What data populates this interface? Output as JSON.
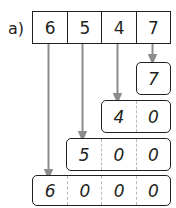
{
  "figure": {
    "part_label": "a)",
    "type": "place-value-decomposition",
    "number": "6547"
  },
  "top_row": {
    "name": "original-number-row",
    "cells": [
      "6",
      "5",
      "4",
      "7"
    ]
  },
  "result_rows": [
    {
      "name": "ones-row",
      "value": "7",
      "cells": [
        "7"
      ],
      "place": "ones"
    },
    {
      "name": "tens-row",
      "value": "40",
      "cells": [
        "4",
        "0"
      ],
      "place": "tens"
    },
    {
      "name": "hundreds-row",
      "value": "500",
      "cells": [
        "5",
        "0",
        "0"
      ],
      "place": "hundreds"
    },
    {
      "name": "thousands-row",
      "value": "6000",
      "cells": [
        "6",
        "0",
        "0",
        "0"
      ],
      "place": "thousands"
    }
  ],
  "arrows": [
    {
      "name": "arrow-thousands",
      "from_digit": "6",
      "to_row": "thousands-row"
    },
    {
      "name": "arrow-hundreds",
      "from_digit": "5",
      "to_row": "hundreds-row"
    },
    {
      "name": "arrow-tens",
      "from_digit": "4",
      "to_row": "tens-row"
    },
    {
      "name": "arrow-ones",
      "from_digit": "7",
      "to_row": "ones-row"
    }
  ],
  "colors": {
    "ink": "#231f20",
    "divider_dashed": "#b9b9b9",
    "arrow": "#8c8c8c",
    "background": "#ffffff"
  }
}
